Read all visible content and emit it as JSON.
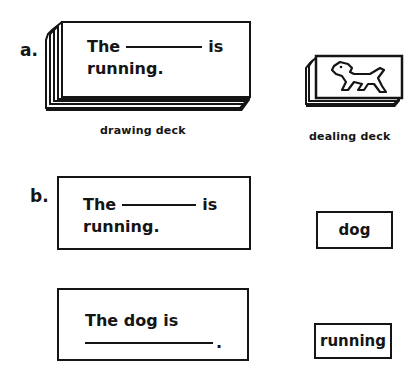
{
  "part_a": {
    "label": "a.",
    "drawing_deck": {
      "caption": "drawing deck",
      "card_text_before": "The",
      "card_text_after": "is",
      "card_line2": "running."
    },
    "dealing_deck": {
      "caption": "dealing deck",
      "image": "dog-picture"
    }
  },
  "part_b": {
    "label": "b.",
    "sentence_card_1": {
      "text_before": "The",
      "text_after": "is",
      "line2": "running."
    },
    "word_card_1": "dog",
    "sentence_card_2": {
      "line1": "The dog is",
      "line2_end": "."
    },
    "word_card_2": "running"
  }
}
